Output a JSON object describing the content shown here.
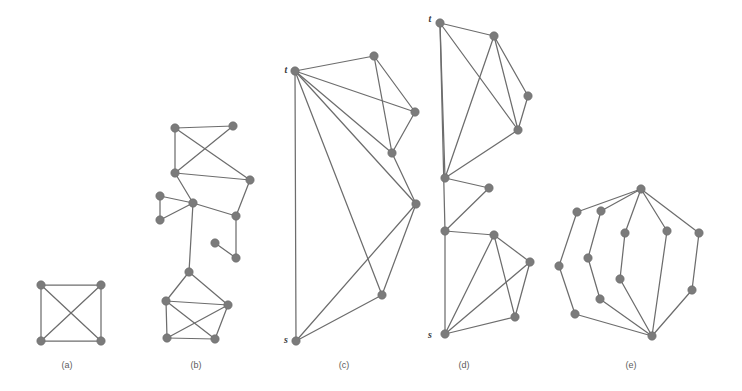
{
  "figure": {
    "background_color": "#ffffff",
    "node_color": "#7b7b7b",
    "edge_color": "#6d6d6d",
    "label_color": "#5c5c5c",
    "node_radius": 4.2,
    "width": 742,
    "height": 391
  },
  "captions": [
    {
      "id": "a",
      "label": "(a)",
      "x": 67,
      "y": 368
    },
    {
      "id": "b",
      "label": "(b)",
      "x": 196,
      "y": 368
    },
    {
      "id": "c",
      "label": "(c)",
      "x": 344,
      "y": 368
    },
    {
      "id": "d",
      "label": "(d)",
      "x": 464,
      "y": 368
    },
    {
      "id": "e",
      "label": "(e)",
      "x": 631,
      "y": 368
    }
  ],
  "terminal_labels": [
    {
      "text": "t",
      "panel": "c",
      "x": 286,
      "y": 73
    },
    {
      "text": "s",
      "panel": "c",
      "x": 286,
      "y": 343
    },
    {
      "text": "t",
      "panel": "d",
      "x": 430,
      "y": 22
    },
    {
      "text": "s",
      "panel": "d",
      "x": 430,
      "y": 338
    }
  ],
  "panels": [
    {
      "id": "a",
      "name": "panel-a",
      "description": "Complete graph K4 drawn as a square with both diagonals",
      "nodes": [
        {
          "id": "a0",
          "x": 41,
          "y": 285
        },
        {
          "id": "a1",
          "x": 101,
          "y": 285
        },
        {
          "id": "a2",
          "x": 101,
          "y": 341
        },
        {
          "id": "a3",
          "x": 41,
          "y": 341
        }
      ],
      "edges": [
        [
          "a0",
          "a1"
        ],
        [
          "a1",
          "a2"
        ],
        [
          "a2",
          "a3"
        ],
        [
          "a3",
          "a0"
        ],
        [
          "a0",
          "a2"
        ],
        [
          "a1",
          "a3"
        ]
      ]
    },
    {
      "id": "b",
      "name": "panel-b",
      "description": "Irregular sparse graph with a pendant pair, a triangle fan and a dense bottom cluster",
      "nodes": [
        {
          "id": "b0",
          "x": 175,
          "y": 128
        },
        {
          "id": "b1",
          "x": 233,
          "y": 126
        },
        {
          "id": "b2",
          "x": 175,
          "y": 173
        },
        {
          "id": "b3",
          "x": 250,
          "y": 180
        },
        {
          "id": "b4",
          "x": 160,
          "y": 196
        },
        {
          "id": "b5",
          "x": 193,
          "y": 203
        },
        {
          "id": "b6",
          "x": 160,
          "y": 220
        },
        {
          "id": "b7",
          "x": 236,
          "y": 216
        },
        {
          "id": "b8",
          "x": 215,
          "y": 243
        },
        {
          "id": "b9",
          "x": 236,
          "y": 258
        },
        {
          "id": "b10",
          "x": 189,
          "y": 272
        },
        {
          "id": "b11",
          "x": 166,
          "y": 301
        },
        {
          "id": "b12",
          "x": 228,
          "y": 305
        },
        {
          "id": "b13",
          "x": 167,
          "y": 338
        },
        {
          "id": "b14",
          "x": 215,
          "y": 339
        }
      ],
      "edges": [
        [
          "b0",
          "b1"
        ],
        [
          "b0",
          "b2"
        ],
        [
          "b0",
          "b3"
        ],
        [
          "b1",
          "b2"
        ],
        [
          "b2",
          "b3"
        ],
        [
          "b2",
          "b5"
        ],
        [
          "b3",
          "b7"
        ],
        [
          "b5",
          "b7"
        ],
        [
          "b5",
          "b4"
        ],
        [
          "b5",
          "b6"
        ],
        [
          "b4",
          "b6"
        ],
        [
          "b7",
          "b9"
        ],
        [
          "b8",
          "b9"
        ],
        [
          "b5",
          "b10"
        ],
        [
          "b10",
          "b11"
        ],
        [
          "b10",
          "b12"
        ],
        [
          "b11",
          "b12"
        ],
        [
          "b11",
          "b13"
        ],
        [
          "b11",
          "b14"
        ],
        [
          "b12",
          "b13"
        ],
        [
          "b12",
          "b14"
        ],
        [
          "b13",
          "b14"
        ]
      ]
    },
    {
      "id": "c",
      "name": "panel-c",
      "description": "s-t graph: terminal t at top-left, terminal s at bottom-left, fan of long edges from t",
      "nodes": [
        {
          "id": "c_t",
          "x": 295,
          "y": 71
        },
        {
          "id": "c1",
          "x": 374,
          "y": 56
        },
        {
          "id": "c2",
          "x": 415,
          "y": 112
        },
        {
          "id": "c3",
          "x": 392,
          "y": 153
        },
        {
          "id": "c4",
          "x": 416,
          "y": 204
        },
        {
          "id": "c5",
          "x": 382,
          "y": 295
        },
        {
          "id": "c_s",
          "x": 296,
          "y": 341
        }
      ],
      "edges": [
        [
          "c_t",
          "c1"
        ],
        [
          "c_t",
          "c2"
        ],
        [
          "c_t",
          "c3"
        ],
        [
          "c_t",
          "c4"
        ],
        [
          "c_t",
          "c5"
        ],
        [
          "c_t",
          "c_s"
        ],
        [
          "c1",
          "c2"
        ],
        [
          "c1",
          "c3"
        ],
        [
          "c2",
          "c3"
        ],
        [
          "c3",
          "c4"
        ],
        [
          "c4",
          "c5"
        ],
        [
          "c4",
          "c_s"
        ],
        [
          "c5",
          "c_s"
        ]
      ]
    },
    {
      "id": "d",
      "name": "panel-d",
      "description": "s-t graph with a vertical spine on the left, zig-zag middle and dense lower cluster",
      "nodes": [
        {
          "id": "d_t",
          "x": 440,
          "y": 23
        },
        {
          "id": "d1",
          "x": 494,
          "y": 36
        },
        {
          "id": "d2",
          "x": 528,
          "y": 96
        },
        {
          "id": "d3",
          "x": 518,
          "y": 130
        },
        {
          "id": "d4",
          "x": 445,
          "y": 178
        },
        {
          "id": "d5",
          "x": 489,
          "y": 188
        },
        {
          "id": "d6",
          "x": 445,
          "y": 231
        },
        {
          "id": "d7",
          "x": 494,
          "y": 235
        },
        {
          "id": "d8",
          "x": 530,
          "y": 262
        },
        {
          "id": "d9",
          "x": 515,
          "y": 317
        },
        {
          "id": "d_s",
          "x": 445,
          "y": 334
        }
      ],
      "edges": [
        [
          "d_t",
          "d1"
        ],
        [
          "d_t",
          "d3"
        ],
        [
          "d_t",
          "d4"
        ],
        [
          "d1",
          "d3"
        ],
        [
          "d1",
          "d2"
        ],
        [
          "d1",
          "d4"
        ],
        [
          "d2",
          "d3"
        ],
        [
          "d3",
          "d4"
        ],
        [
          "d_t",
          "d6"
        ],
        [
          "d4",
          "d5"
        ],
        [
          "d5",
          "d6"
        ],
        [
          "d6",
          "d7"
        ],
        [
          "d6",
          "d_s"
        ],
        [
          "d7",
          "d8"
        ],
        [
          "d7",
          "d9"
        ],
        [
          "d7",
          "d_s"
        ],
        [
          "d8",
          "d9"
        ],
        [
          "d8",
          "d_s"
        ],
        [
          "d9",
          "d_s"
        ]
      ]
    },
    {
      "id": "e",
      "name": "panel-e",
      "description": "Theta-like graph: top hub and bottom hub joined by several internally disjoint paths",
      "nodes": [
        {
          "id": "e_top",
          "x": 641,
          "y": 189
        },
        {
          "id": "e_bot",
          "x": 652,
          "y": 336
        },
        {
          "id": "e1",
          "x": 577,
          "y": 212
        },
        {
          "id": "e2",
          "x": 559,
          "y": 266
        },
        {
          "id": "e3",
          "x": 575,
          "y": 314
        },
        {
          "id": "e4",
          "x": 601,
          "y": 211
        },
        {
          "id": "e5",
          "x": 588,
          "y": 258
        },
        {
          "id": "e6",
          "x": 600,
          "y": 299
        },
        {
          "id": "e7",
          "x": 625,
          "y": 233
        },
        {
          "id": "e8",
          "x": 620,
          "y": 279
        },
        {
          "id": "e9",
          "x": 667,
          "y": 231
        },
        {
          "id": "e10",
          "x": 699,
          "y": 233
        },
        {
          "id": "e11",
          "x": 692,
          "y": 290
        }
      ],
      "edges": [
        [
          "e_top",
          "e1"
        ],
        [
          "e1",
          "e2"
        ],
        [
          "e2",
          "e3"
        ],
        [
          "e3",
          "e_bot"
        ],
        [
          "e_top",
          "e4"
        ],
        [
          "e4",
          "e5"
        ],
        [
          "e5",
          "e6"
        ],
        [
          "e6",
          "e_bot"
        ],
        [
          "e_top",
          "e7"
        ],
        [
          "e7",
          "e8"
        ],
        [
          "e8",
          "e_bot"
        ],
        [
          "e_top",
          "e9"
        ],
        [
          "e9",
          "e_bot"
        ],
        [
          "e_top",
          "e10"
        ],
        [
          "e10",
          "e11"
        ],
        [
          "e11",
          "e_bot"
        ]
      ]
    }
  ],
  "chart_data": {
    "type": "diagram",
    "subtype": "node-link-graphs",
    "panel_count": 5,
    "panel_summaries": [
      {
        "panel": "(a)",
        "nodes": 4,
        "edges": 6,
        "note": "complete graph K4"
      },
      {
        "panel": "(b)",
        "nodes": 15,
        "edges": 22,
        "note": "irregular graph with pendant edge and dense bottom cluster"
      },
      {
        "panel": "(c)",
        "nodes": 7,
        "edges": 13,
        "note": "s-t graph, t top-left, s bottom-left"
      },
      {
        "panel": "(d)",
        "nodes": 11,
        "edges": 19,
        "note": "s-t graph, t top-left, s bottom-left"
      },
      {
        "panel": "(e)",
        "nodes": 13,
        "edges": 16,
        "note": "theta graph, five internally disjoint top-bottom paths"
      }
    ]
  }
}
